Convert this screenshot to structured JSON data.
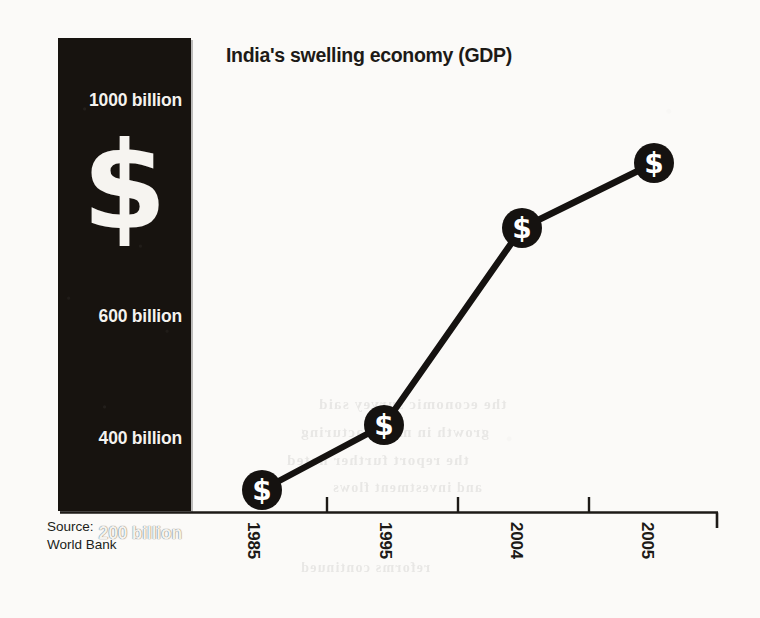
{
  "chart_data": {
    "type": "line",
    "title": "India's swelling economy (GDP)",
    "xlabel": "",
    "ylabel": "",
    "categories": [
      "1985",
      "1995",
      "2004",
      "2005"
    ],
    "values": [
      200,
      280,
      800,
      920
    ],
    "unit": "billion",
    "ytick_labels": [
      "1000 billion",
      "600 billion",
      "400 billion",
      "200 billion"
    ],
    "ytick_values": [
      1000,
      600,
      400,
      200
    ],
    "ylim": [
      200,
      1000
    ],
    "grid": false,
    "legend": null,
    "marker": "dollar-sign-circle",
    "series": [
      {
        "name": "GDP",
        "values": [
          200,
          280,
          800,
          920
        ]
      }
    ],
    "source": "World Bank",
    "annotations": []
  },
  "title": {
    "text": "India's swelling economy (GDP)"
  },
  "panel": {
    "decorative_symbol": "$",
    "ytick_labels": [
      {
        "label": "1000 billion",
        "top": 52
      },
      {
        "label": "600 billion",
        "top": 268
      },
      {
        "label": "400 billion",
        "top": 390
      },
      {
        "label": "200 billion",
        "top": 485
      }
    ]
  },
  "xaxis": {
    "ticks": [
      {
        "label": "1985",
        "x": 263
      },
      {
        "label": "1995",
        "x": 395
      },
      {
        "label": "2004",
        "x": 526
      },
      {
        "label": "2005",
        "x": 657
      }
    ]
  },
  "points": [
    {
      "year": "1985",
      "cx": 262,
      "cy": 490,
      "marker": "$"
    },
    {
      "year": "1995",
      "cx": 384,
      "cy": 425,
      "marker": "$"
    },
    {
      "year": "2004",
      "cx": 522,
      "cy": 228,
      "marker": "$"
    },
    {
      "year": "2005",
      "cx": 654,
      "cy": 163,
      "marker": "$"
    }
  ],
  "source": {
    "line1": "Source:",
    "line2": "World Bank"
  },
  "ghost": {
    "rows": [
      {
        "text": "the economic survey said",
        "left": 318,
        "top": 396,
        "size": 15
      },
      {
        "text": "growth in manufacturing",
        "left": 300,
        "top": 424,
        "size": 15
      },
      {
        "text": "the report further noted",
        "left": 286,
        "top": 452,
        "size": 15
      },
      {
        "text": "and investment flows",
        "left": 332,
        "top": 480,
        "size": 14
      },
      {
        "text": "reforms continued",
        "left": 300,
        "top": 560,
        "size": 14
      }
    ]
  },
  "colors": {
    "panel_background": "#17130f",
    "panel_text": "#f4f2ee",
    "ink": "#1d1a17",
    "paper": "#fbfaf8",
    "marker_fill": "#151210",
    "marker_glyph": "#ffffff"
  }
}
